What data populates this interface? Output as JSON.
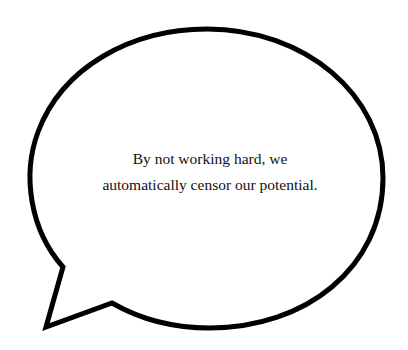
{
  "speech_bubble": {
    "lines": [
      "By not working hard, we",
      "automatically censor our potential."
    ],
    "stroke_color": "#000000",
    "fill_color": "#ffffff",
    "text_color": "#111111"
  }
}
